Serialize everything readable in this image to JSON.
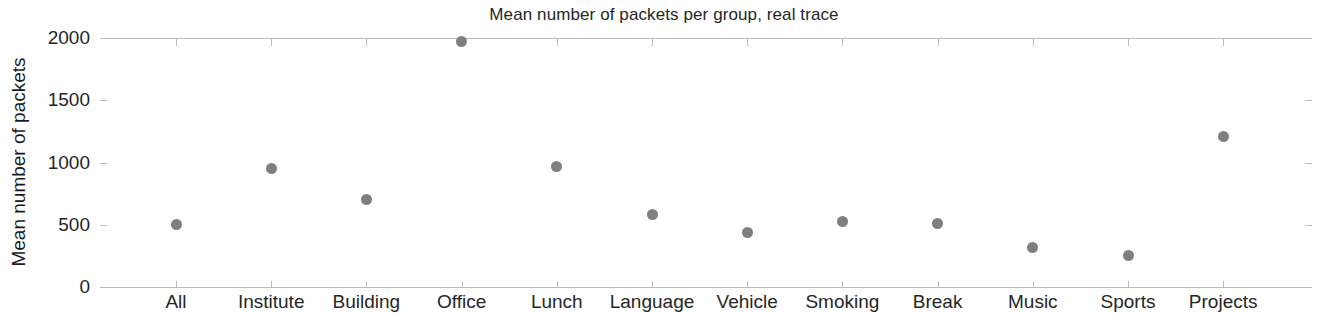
{
  "chart_data": {
    "type": "scatter",
    "title": "Mean number of packets per group, real trace",
    "xlabel": "",
    "ylabel": "Mean number of packets",
    "categories": [
      "All",
      "Institute",
      "Building",
      "Office",
      "Lunch",
      "Language",
      "Vehicle",
      "Smoking",
      "Break",
      "Music",
      "Sports",
      "Projects"
    ],
    "values": [
      500,
      955,
      705,
      1975,
      965,
      580,
      435,
      525,
      510,
      315,
      250,
      1210
    ],
    "ylim": [
      0,
      2000
    ],
    "yticks": [
      0,
      500,
      1000,
      1500,
      2000
    ],
    "ytick_labels": [
      "0",
      "500",
      "1000",
      "1500",
      "2000"
    ],
    "grid": false,
    "legend": null,
    "marker_color": "#7f7f7f",
    "axis_color": "#bdbdbd",
    "text_color": "#262626"
  }
}
